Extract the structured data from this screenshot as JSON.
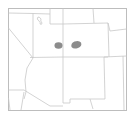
{
  "map": {
    "region": "US Southwest (Utah, Colorado, Arizona, New Mexico)",
    "colors": {
      "background": "#ffffff",
      "border": "#c8c8c8",
      "frame": "#bdbdbd",
      "highlight": "#8c8c8c"
    },
    "highlights": [
      {
        "id": "blob-west",
        "cx": 58.5,
        "cy": 45.5,
        "rx": 4,
        "ry": 3.3
      },
      {
        "id": "blob-east",
        "cx": 76.5,
        "cy": 45,
        "rx": 5,
        "ry": 3.6
      }
    ]
  }
}
